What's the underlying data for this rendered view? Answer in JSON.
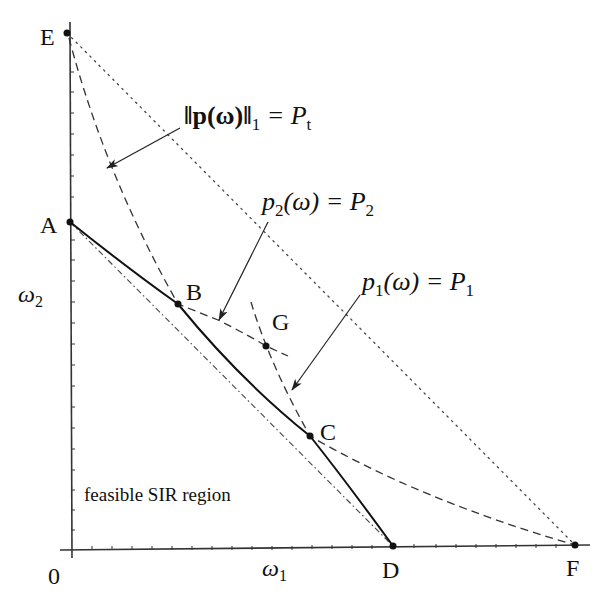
{
  "diagram": {
    "axes": {
      "x_label": "ω",
      "x_label_sub": "1",
      "y_label": "ω",
      "y_label_sub": "2",
      "origin_label": "0"
    },
    "points": {
      "A": "A",
      "B": "B",
      "C": "C",
      "D": "D",
      "E": "E",
      "F": "F",
      "G": "G"
    },
    "annotations": {
      "total_power": {
        "lhs": "‖p(ω)‖",
        "sub": "1",
        "eq": " = P",
        "rhs_sub": "t"
      },
      "p2_constraint": {
        "lhs": "p",
        "lhs_sub": "2",
        "mid": "(ω) = P",
        "rhs_sub": "2"
      },
      "p1_constraint": {
        "lhs": "p",
        "lhs_sub": "1",
        "mid": "(ω) = P",
        "rhs_sub": "1"
      },
      "region": "feasible SIR region"
    },
    "legend_styles": {
      "boundary": "solid",
      "power_constraints": "dashed",
      "total_power_line": "dotted",
      "lower_bound": "dash-dot"
    }
  }
}
